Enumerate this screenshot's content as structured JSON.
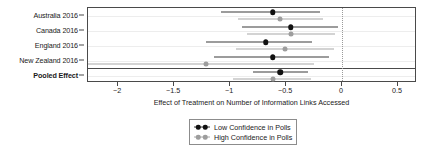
{
  "chart_data": {
    "type": "scatter",
    "subtype": "forest-plot",
    "title": "",
    "xlabel": "Effect of Treatment on Number of Information Links Accessed",
    "ylabel": "",
    "xlim": [
      -2.27,
      0.67
    ],
    "xticks": [
      -2,
      -1.5,
      -1,
      -0.5,
      0,
      0.5
    ],
    "xticklabels": [
      "−2",
      "−1.5",
      "−1",
      "−0.5",
      "0",
      "0.5"
    ],
    "grid": true,
    "reference_line": 0,
    "legend_position": "bottom-center",
    "categories": [
      "Australia 2016",
      "Canada 2016",
      "England 2016",
      "New Zealand 2016",
      "Pooled Effect"
    ],
    "pooled_row": "Pooled Effect",
    "series": [
      {
        "name": "Low Confidence in Polls",
        "color": "#111111",
        "values": [
          -0.62,
          -0.46,
          -0.68,
          -0.62,
          -0.55
        ],
        "ci_low": [
          -1.08,
          -0.89,
          -1.22,
          -1.14,
          -0.8
        ],
        "ci_high": [
          -0.2,
          -0.04,
          -0.27,
          -0.12,
          -0.3
        ]
      },
      {
        "name": "High Confidence in Polls",
        "color": "#9d9d9d",
        "values": [
          -0.55,
          -0.46,
          -0.51,
          -1.22,
          -0.62
        ],
        "ci_low": [
          -0.93,
          -0.85,
          -0.95,
          -2.27,
          -0.97
        ],
        "ci_high": [
          -0.17,
          -0.06,
          -0.07,
          -0.25,
          -0.28
        ]
      }
    ]
  },
  "legend": {
    "entries": [
      {
        "label": "Low Confidence in Polls",
        "style": "low"
      },
      {
        "label": "High Confidence in Polls",
        "style": "high"
      }
    ]
  }
}
